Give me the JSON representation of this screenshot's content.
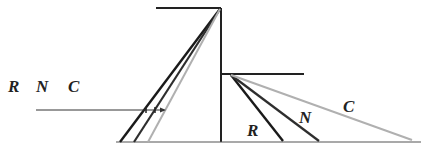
{
  "diagram": {
    "legend_labels": [
      "R",
      "N",
      "C"
    ],
    "ray_labels": {
      "red": "R",
      "neutral": "N",
      "cyan": "C"
    },
    "colors": {
      "R": "#1a1a1a",
      "N": "#2e2e2e",
      "C": "#b0b0b0",
      "structure": "#222222",
      "baseline": "#555555"
    }
  }
}
